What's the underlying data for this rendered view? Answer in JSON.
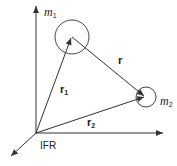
{
  "diagram": {
    "frame_label": "IFR",
    "bodies": [
      {
        "name": "m",
        "subscript": "1",
        "center": [
          72,
          37
        ],
        "radius": 17
      },
      {
        "name": "m",
        "subscript": "2",
        "center": [
          145,
          97
        ],
        "radius": 10
      }
    ],
    "vectors": [
      {
        "name": "r",
        "subscript": "1",
        "from": "origin",
        "to": "m1"
      },
      {
        "name": "r",
        "subscript": "2",
        "from": "origin",
        "to": "m2"
      },
      {
        "name": "r",
        "subscript": "",
        "from": "m1",
        "to": "m2"
      }
    ],
    "axes": [
      "x-axis",
      "y-axis",
      "z-axis"
    ],
    "colors": {
      "line": "#333333",
      "background": "#ffffff"
    }
  }
}
